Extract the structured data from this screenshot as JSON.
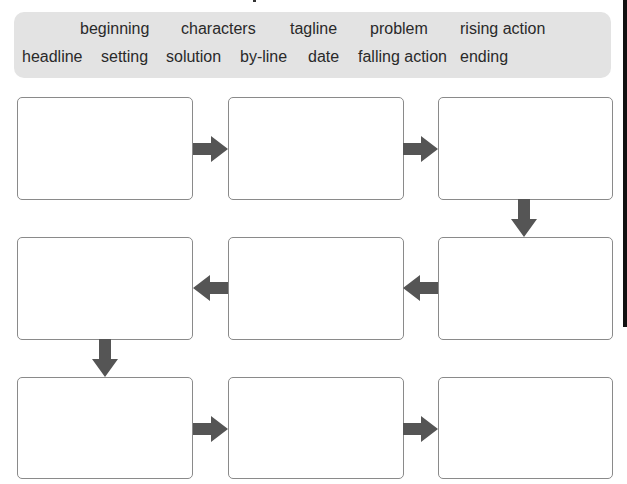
{
  "word_bank": {
    "row1": [
      "beginning",
      "characters",
      "tagline",
      "problem",
      "rising action"
    ],
    "row2": [
      "headline",
      "setting",
      "solution",
      "by-line",
      "date",
      "falling action",
      "ending"
    ]
  },
  "flowchart": {
    "boxes": [
      {
        "id": 1,
        "text": ""
      },
      {
        "id": 2,
        "text": ""
      },
      {
        "id": 3,
        "text": ""
      },
      {
        "id": 4,
        "text": ""
      },
      {
        "id": 5,
        "text": ""
      },
      {
        "id": 6,
        "text": ""
      },
      {
        "id": 7,
        "text": ""
      },
      {
        "id": 8,
        "text": ""
      },
      {
        "id": 9,
        "text": ""
      }
    ],
    "arrow_color": "#555555",
    "flow": [
      "right",
      "right",
      "down",
      "left",
      "left",
      "down",
      "right",
      "right"
    ]
  }
}
